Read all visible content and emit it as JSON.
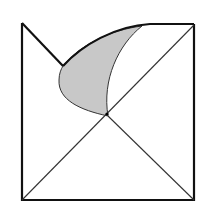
{
  "figure": {
    "colors": {
      "stroke": "#111111",
      "shade": "#c8c8c8",
      "background": "#ffffff"
    },
    "labels": []
  }
}
